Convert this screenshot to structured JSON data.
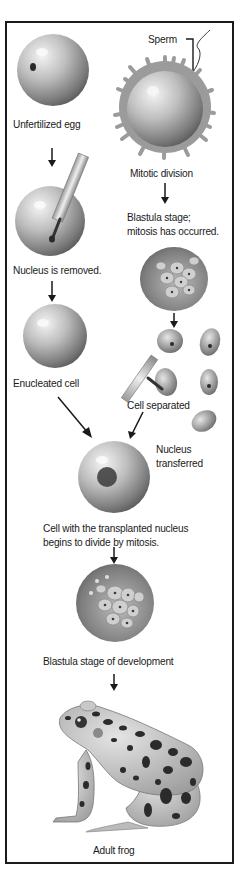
{
  "diagram": {
    "labels": {
      "sperm": "Sperm",
      "unfertilized_egg": "Unfertilized egg",
      "mitotic_division": "Mitotic division",
      "blastula_mitosis_1": "Blastula stage;",
      "blastula_mitosis_2": "mitosis has occurred.",
      "nucleus_removed": "Nucleus is removed.",
      "enucleated_cell": "Enucleated cell",
      "cell_separated": "Cell separated",
      "nucleus_transferred_1": "Nucleus",
      "nucleus_transferred_2": "transferred",
      "transplanted_1": "Cell with the transplanted nucleus",
      "transplanted_2": "begins to divide by mitosis.",
      "blastula_development": "Blastula stage of development",
      "adult_frog": "Adult frog"
    },
    "colors": {
      "border": "#1a1a1a",
      "cell_light": "#e8e8e8",
      "cell_dark": "#6e6e6e",
      "nucleus": "#2a2a2a",
      "frog_body": "#c9c9c9",
      "frog_spots": "#2b2b2b"
    }
  }
}
